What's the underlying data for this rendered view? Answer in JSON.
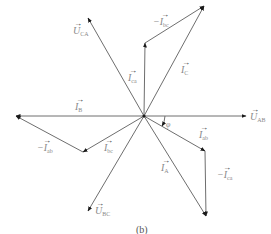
{
  "figure": {
    "caption": "(b)",
    "origin": [
      144,
      116
    ],
    "line_color": "#6e6e6e",
    "arrow_color": "#1a1a1a",
    "label_color": "#8a8a8a"
  },
  "phasors": [
    {
      "id": "U_AB",
      "from": [
        144,
        116
      ],
      "to": [
        246,
        116
      ],
      "label_main": "U",
      "label_sub": "AB",
      "prefix": ""
    },
    {
      "id": "I_B",
      "from": [
        144,
        116
      ],
      "to": [
        16,
        116
      ],
      "label_main": "I",
      "label_sub": "B",
      "prefix": ""
    },
    {
      "id": "U_CA",
      "from": [
        144,
        116
      ],
      "to": [
        88,
        18
      ],
      "label_main": "U",
      "label_sub": "CA",
      "prefix": ""
    },
    {
      "id": "I_C",
      "from": [
        144,
        116
      ],
      "to": [
        204,
        6
      ],
      "label_main": "I",
      "label_sub": "C",
      "prefix": ""
    },
    {
      "id": "I_ca",
      "from": [
        144,
        116
      ],
      "to": [
        145,
        43
      ],
      "label_main": "I",
      "label_sub": "ca",
      "prefix": ""
    },
    {
      "id": "neg_I_bc",
      "from": [
        145,
        43
      ],
      "to": [
        204,
        6
      ],
      "label_main": "I",
      "label_sub": "bc",
      "prefix": "−"
    },
    {
      "id": "I_ab",
      "from": [
        144,
        116
      ],
      "to": [
        205,
        151
      ],
      "label_main": "I",
      "label_sub": "ab",
      "prefix": ""
    },
    {
      "id": "neg_I_ca",
      "from": [
        205,
        151
      ],
      "to": [
        206,
        216
      ],
      "label_main": "I",
      "label_sub": "ca",
      "prefix": "−"
    },
    {
      "id": "I_A",
      "from": [
        144,
        116
      ],
      "to": [
        206,
        216
      ],
      "label_main": "I",
      "label_sub": "A",
      "prefix": ""
    },
    {
      "id": "U_BC",
      "from": [
        144,
        116
      ],
      "to": [
        88,
        211
      ],
      "label_main": "U",
      "label_sub": "BC",
      "prefix": ""
    },
    {
      "id": "I_bc",
      "from": [
        144,
        116
      ],
      "to": [
        83,
        152
      ],
      "label_main": "I",
      "label_sub": "bc",
      "prefix": ""
    },
    {
      "id": "neg_I_ab",
      "from": [
        83,
        152
      ],
      "to": [
        16,
        116
      ],
      "label_main": "I",
      "label_sub": "ab",
      "prefix": "−"
    }
  ],
  "labels": {
    "U_AB": {
      "main": "U",
      "sub": "AB",
      "prefix": ""
    },
    "I_B": {
      "main": "I",
      "sub": "B",
      "prefix": ""
    },
    "U_CA": {
      "main": "U",
      "sub": "CA",
      "prefix": ""
    },
    "I_C": {
      "main": "I",
      "sub": "C",
      "prefix": ""
    },
    "I_ca": {
      "main": "I",
      "sub": "ca",
      "prefix": ""
    },
    "neg_I_bc": {
      "main": "I",
      "sub": "bc",
      "prefix": "−"
    },
    "I_ab": {
      "main": "I",
      "sub": "ab",
      "prefix": ""
    },
    "neg_I_ca": {
      "main": "I",
      "sub": "ca",
      "prefix": "−"
    },
    "I_A": {
      "main": "I",
      "sub": "A",
      "prefix": ""
    },
    "U_BC": {
      "main": "U",
      "sub": "BC",
      "prefix": ""
    },
    "I_bc": {
      "main": "I",
      "sub": "bc",
      "prefix": ""
    },
    "neg_I_ab": {
      "main": "I",
      "sub": "ab",
      "prefix": "−"
    }
  },
  "angle": {
    "symbol": "φ",
    "label": "φ"
  },
  "vector_arrow": "→"
}
